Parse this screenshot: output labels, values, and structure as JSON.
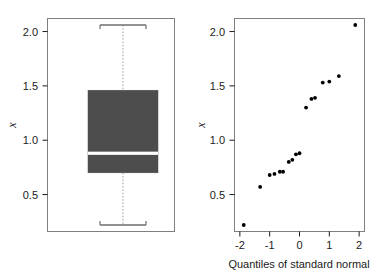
{
  "figure": {
    "background_color": "#ffffff",
    "foreground_color": "#1a1a1a",
    "box_fill_color": "#4d4d4d",
    "median_color": "#ffffff",
    "point_color": "#000000"
  },
  "chart_data": [
    {
      "type": "box",
      "panel_name": "boxplot-panel",
      "title": "",
      "xlabel": "",
      "ylabel": "x",
      "ylim": [
        0.16,
        2.12
      ],
      "yticks": [
        0.5,
        1.0,
        1.5,
        2.0
      ],
      "ytick_labels": [
        "0.5",
        "1.0",
        "1.5",
        "2.0"
      ],
      "xticks": [],
      "xtick_labels": [],
      "grid": false,
      "legend": "none",
      "boxes": [
        {
          "name": "x",
          "whisker_low": 0.22,
          "q1": 0.7,
          "median": 0.88,
          "q3": 1.46,
          "whisker_high": 2.06,
          "outliers": []
        }
      ],
      "notes": "Single vertical box with dotted whisker lines and bracket-style whisker caps; median drawn as a white horizontal band."
    },
    {
      "type": "scatter",
      "panel_name": "qq-panel",
      "title": "",
      "xlabel": "Quantiles of standard normal",
      "ylabel": "x",
      "xlim": [
        -2.18,
        2.18
      ],
      "ylim": [
        0.16,
        2.12
      ],
      "xticks": [
        -2,
        -1,
        0,
        1,
        2
      ],
      "xtick_labels": [
        "-2",
        "-1",
        "0",
        "1",
        "2"
      ],
      "yticks": [
        0.5,
        1.0,
        1.5,
        2.0
      ],
      "ytick_labels": [
        "0.5",
        "1.0",
        "1.5",
        "2.0"
      ],
      "grid": false,
      "legend": "none",
      "marker": "filled-circle",
      "x": [
        -1.87,
        -1.32,
        -1.0,
        -0.84,
        -0.66,
        -0.55,
        -0.36,
        -0.24,
        -0.12,
        0.0,
        0.12,
        0.24,
        0.36,
        0.55,
        0.66,
        0.84,
        1.0,
        1.32,
        1.87
      ],
      "y": [
        0.22,
        0.57,
        0.68,
        0.69,
        0.71,
        0.71,
        0.8,
        0.82,
        0.87,
        0.88,
        1.3,
        1.38,
        1.39,
        1.53,
        1.54,
        1.59,
        2.06,
        null,
        null
      ],
      "points": [
        {
          "x": -1.87,
          "y": 0.22
        },
        {
          "x": -1.32,
          "y": 0.57
        },
        {
          "x": -1.0,
          "y": 0.68
        },
        {
          "x": -0.84,
          "y": 0.69
        },
        {
          "x": -0.66,
          "y": 0.71
        },
        {
          "x": -0.55,
          "y": 0.71
        },
        {
          "x": -0.36,
          "y": 0.8
        },
        {
          "x": -0.24,
          "y": 0.82
        },
        {
          "x": -0.12,
          "y": 0.87
        },
        {
          "x": 0.0,
          "y": 0.88
        },
        {
          "x": 0.22,
          "y": 1.3
        },
        {
          "x": 0.4,
          "y": 1.38
        },
        {
          "x": 0.52,
          "y": 1.39
        },
        {
          "x": 0.78,
          "y": 1.53
        },
        {
          "x": 1.0,
          "y": 1.54
        },
        {
          "x": 1.32,
          "y": 1.59
        },
        {
          "x": 1.87,
          "y": 2.06
        }
      ]
    }
  ]
}
